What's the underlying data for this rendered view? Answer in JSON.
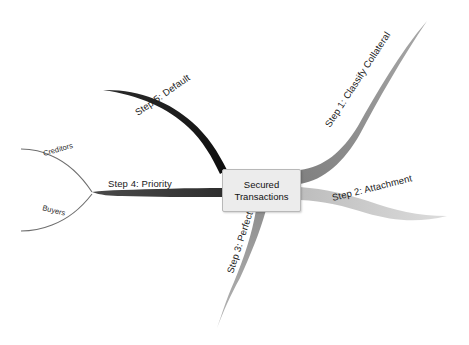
{
  "diagram": {
    "type": "mind-map",
    "background_color": "#ffffff",
    "center": {
      "label_line1": "Secured",
      "label_line2": "Transactions",
      "fill_color": "#ececec",
      "border_color": "#b8b8b8"
    },
    "branches": [
      {
        "id": "step1",
        "label": "Step 1: Classify Collateral",
        "color": "#8c8c8c",
        "direction": "upper-right",
        "label_rotation": -57,
        "label_x": 330,
        "label_y": 128,
        "path": "M 300 176 C 322 172 340 158 356 132 C 374 100 398 56 426 22",
        "width_root": 13,
        "width_tip": 1
      },
      {
        "id": "step2",
        "label": "Step 2: Attachment",
        "color": "#c9c9c9",
        "direction": "right",
        "label_rotation": -14,
        "label_x": 333,
        "label_y": 200,
        "path": "M 300 193 C 324 195 344 200 366 207 C 392 215 416 220 446 219",
        "width_root": 13,
        "width_tip": 1
      },
      {
        "id": "step3",
        "label": "Step 3: Perfection",
        "color": "#9a9a9a",
        "direction": "bottom",
        "label_rotation": -72,
        "label_x": 233,
        "label_y": 273,
        "path": "M 262 212 C 258 234 250 258 240 282 C 232 300 226 314 218 327",
        "width_root": 12,
        "width_tip": 1
      },
      {
        "id": "step4",
        "label": "Step 4: Priority",
        "color": "#3a3a3a",
        "direction": "left",
        "label_rotation": 0,
        "label_x": 108,
        "label_y": 186,
        "path": "M 222 192 C 190 192 150 193 122 193 C 110 193 100 193 92 193",
        "width_root": 8,
        "width_tip": 2
      },
      {
        "id": "step5",
        "label": "Step 5: Default",
        "color": "#111111",
        "direction": "upper-left",
        "label_rotation": -35,
        "label_x": 138,
        "label_y": 115,
        "path": "M 232 169 C 222 152 210 134 194 120 C 172 100 140 88 104 90",
        "width_root": 11,
        "width_tip": 1
      }
    ],
    "sub_branches": [
      {
        "id": "creditors",
        "label": "Creditors",
        "parent": "step4",
        "color": "#6f6f6f",
        "label_rotation": -16,
        "label_x": 44,
        "label_y": 155,
        "path": "M 92 193 C 82 178 68 164 52 157 C 42 152 32 150 22 150"
      },
      {
        "id": "buyers",
        "label": "Buyers",
        "parent": "step4",
        "color": "#6f6f6f",
        "label_rotation": 14,
        "label_x": 42,
        "label_y": 208,
        "path": "M 92 193 C 82 206 68 218 52 224 C 42 228 32 230 22 230"
      }
    ]
  }
}
